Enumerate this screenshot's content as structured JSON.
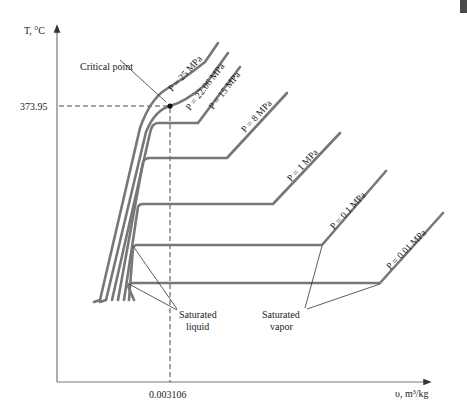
{
  "diagram": {
    "axes": {
      "y_label": "T, °C",
      "x_label": "υ, m³/kg",
      "y_tick": "373.95",
      "x_tick": "0.003106"
    },
    "annotations": {
      "critical_point": "Critical point",
      "saturated_liquid_line1": "Saturated",
      "saturated_liquid_line2": "liquid",
      "saturated_vapor_line1": "Saturated",
      "saturated_vapor_line2": "vapor"
    },
    "isobars": [
      {
        "label": "P = 25 MPa"
      },
      {
        "label": "P = 22.06 MPa"
      },
      {
        "label": "P = 15 MPa"
      },
      {
        "label": "P = 8 MPa"
      },
      {
        "label": "P = 1 MPa"
      },
      {
        "label": "P = 0.1 MPa"
      },
      {
        "label": "P = 0.01 MPa"
      }
    ],
    "colors": {
      "curve": "#777777",
      "text": "#222222",
      "background": "#ffffff"
    }
  }
}
